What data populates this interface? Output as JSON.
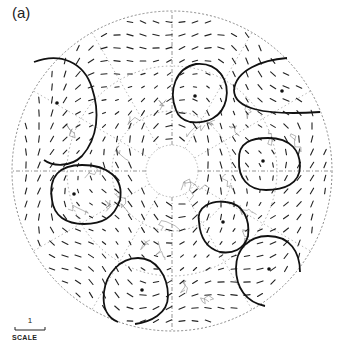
{
  "figure": {
    "panel_label": "(a)",
    "scale": {
      "value": "1",
      "label": "SCALE"
    },
    "projection": {
      "center": [
        172,
        171
      ],
      "radius": 160,
      "inner_hub_radius": 26,
      "latitude_rings": [
        60,
        105,
        160
      ],
      "meridian_count": 12
    },
    "contours": [
      {
        "id": "c1",
        "center": [
          57,
          103
        ],
        "path": "M 34 62 C 60 52, 84 62, 92 88 C 100 112, 98 138, 82 156 C 70 168, 52 166, 44 160"
      },
      {
        "id": "c2",
        "center": [
          195,
          96
        ],
        "path": "M 176 110 C 168 90, 176 68, 196 64 C 218 62, 230 80, 226 100 C 222 118, 206 124, 190 122 C 182 120, 178 116, 176 110 Z"
      },
      {
        "id": "c3",
        "center": [
          282,
          91
        ],
        "path": "M 287 58 C 262 60, 236 70, 234 90 C 234 108, 262 116, 320 112"
      },
      {
        "id": "c4",
        "center": [
          263,
          161
        ],
        "path": "M 239 160 C 238 142, 252 138, 268 138 C 292 138, 300 152, 300 166 C 300 184, 284 190, 266 190 C 248 190, 238 178, 239 160 Z"
      },
      {
        "id": "c5",
        "center": [
          74,
          194
        ],
        "path": "M 52 200 C 48 176, 60 165, 82 165 C 108 165, 124 178, 120 200 C 114 218, 102 224, 84 224 C 66 224, 54 216, 52 200 Z"
      },
      {
        "id": "c6",
        "center": [
          223,
          222
        ],
        "path": "M 199 222 C 196 206, 212 200, 226 202 C 244 204, 250 220, 248 236 C 244 250, 232 254, 220 252 C 206 248, 200 236, 199 222 Z"
      },
      {
        "id": "c7",
        "center": [
          269,
          269
        ],
        "path": "M 300 272 C 300 252, 290 236, 268 236 C 248 236, 236 250, 236 268 C 236 288, 246 302, 265 306"
      },
      {
        "id": "c8",
        "center": [
          142,
          290
        ],
        "path": "M 135 324 C 150 322, 168 314, 168 296 C 168 276, 156 258, 138 258 C 120 258, 106 274, 104 292 C 102 308, 108 318, 118 322"
      }
    ],
    "vector_field": {
      "description": "short line segments indicating vector direction and magnitude at grid points",
      "color": "#222222"
    },
    "colors": {
      "contour": "#111111",
      "grid": "#888888",
      "coast": "#555555",
      "vectors": "#222222"
    }
  }
}
